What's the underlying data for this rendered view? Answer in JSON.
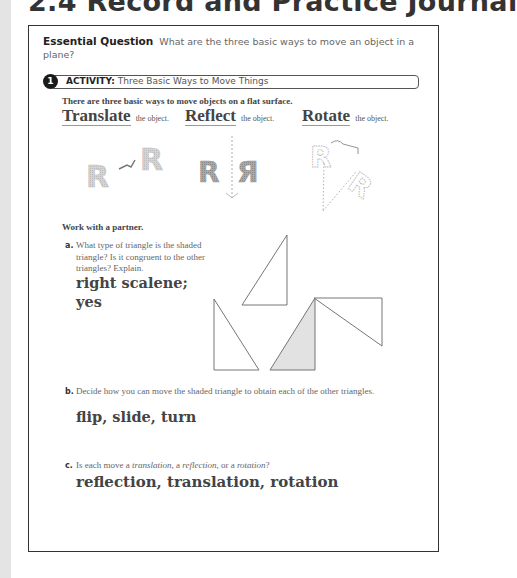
{
  "page": {
    "title": "2.4 Record and Practice Journal"
  },
  "essential_question": {
    "label": "Essential Question",
    "text": "What are the three basic ways to move an object in a plane?"
  },
  "activity": {
    "number": "1",
    "label": "ACTIVITY:",
    "title": "Three Basic Ways to Move Things",
    "intro": "There are three basic ways to move objects on a flat surface.",
    "moves": [
      {
        "word": "Translate",
        "suffix": "the object."
      },
      {
        "word": "Reflect",
        "suffix": "the object."
      },
      {
        "word": "Rotate",
        "suffix": "the object."
      }
    ],
    "figure_letter": "R",
    "figure_letter_mirrored": "Я"
  },
  "work": {
    "heading": "Work with a partner.",
    "questions": [
      {
        "letter": "a.",
        "text": "What type of triangle is the shaded triangle? Is it congruent to the other triangles? Explain.",
        "answer_line1": "right scalene;",
        "answer_line2": "yes"
      },
      {
        "letter": "b.",
        "text": "Decide how you can move the shaded triangle to obtain each of the other triangles.",
        "answer": "flip, slide, turn"
      },
      {
        "letter": "c.",
        "text_pre": "Is each move a ",
        "term1": "translation",
        "text_mid1": ", a ",
        "term2": "reflection",
        "text_mid2": ", or a ",
        "term3": "rotation",
        "text_post": "?",
        "answer": "reflection, translation, rotation"
      }
    ]
  },
  "triangles": [
    {
      "name": "triangle-top",
      "points": "287,235 242,305 287,305",
      "shaded": false
    },
    {
      "name": "triangle-left",
      "points": "214,299 214,370 259,370",
      "shaded": false
    },
    {
      "name": "triangle-shaded",
      "points": "315,298 270,370 315,370",
      "shaded": true
    },
    {
      "name": "triangle-right",
      "points": "314,298 382,298 382,346",
      "shaded": false
    }
  ],
  "colors": {
    "shade_fill": "#e2e2e2",
    "outline": "#666666",
    "letter_gray": "#c8c8c8",
    "letter_dark": "#9a9a9a"
  }
}
